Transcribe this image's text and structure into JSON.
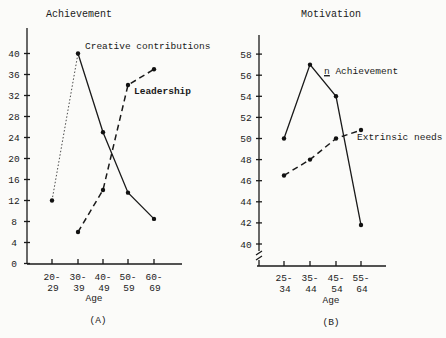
{
  "chart_data": [
    {
      "type": "line",
      "panel": "(A)",
      "title": "Achievement",
      "xlabel": "Age",
      "ylabel": "",
      "categories": [
        "20-29",
        "30-39",
        "40-49",
        "50-59",
        "60-69"
      ],
      "category_labels": [
        [
          "20-",
          "29"
        ],
        [
          "30-",
          "39"
        ],
        [
          "40-",
          "49"
        ],
        [
          "50-",
          "59"
        ],
        [
          "60-",
          "69"
        ]
      ],
      "yticks": [
        0,
        4,
        8,
        12,
        16,
        20,
        24,
        28,
        32,
        36,
        40
      ],
      "ylim": [
        0,
        44
      ],
      "grid": false,
      "legend_position": "inline labels",
      "series": [
        {
          "name": "Creative contributions",
          "style": "solid",
          "values": [
            12,
            40,
            25,
            13.5,
            8.5
          ]
        },
        {
          "name": "Leadership",
          "style": "dashed",
          "values": [
            null,
            6,
            14,
            34,
            37
          ]
        }
      ]
    },
    {
      "type": "line",
      "panel": "(B)",
      "title": "Motivation",
      "xlabel": "Age",
      "ylabel": "",
      "categories": [
        "25-34",
        "35-44",
        "45-54",
        "55-64"
      ],
      "category_labels": [
        [
          "25-",
          "34"
        ],
        [
          "35-",
          "44"
        ],
        [
          "45-",
          "54"
        ],
        [
          "55-",
          "64"
        ]
      ],
      "yticks": [
        40,
        42,
        44,
        46,
        48,
        50,
        52,
        54,
        56,
        58
      ],
      "ylim": [
        39,
        60
      ],
      "axis_break": true,
      "grid": false,
      "legend_position": "inline labels",
      "series": [
        {
          "name": "n Achievement",
          "style": "solid",
          "values": [
            50,
            57,
            54,
            41.8
          ]
        },
        {
          "name": "Extrinsic needs",
          "style": "dashed",
          "values": [
            46.5,
            48,
            50,
            50.8
          ]
        }
      ]
    }
  ],
  "labels": {
    "a_title": "Achievement",
    "a_panel": "(A)",
    "a_xlabel": "Age",
    "a_series1": "Creative contributions",
    "a_series2": "Leadership",
    "b_title": "Motivation",
    "b_panel": "(B)",
    "b_xlabel": "Age",
    "b_series1_n": "n",
    "b_series1_rest": " Achievement",
    "b_series2": "Extrinsic needs"
  }
}
